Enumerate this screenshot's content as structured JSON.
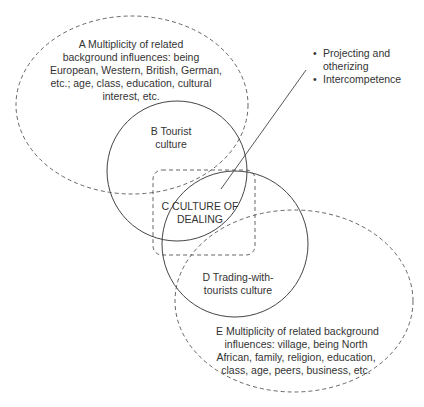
{
  "diagram": {
    "type": "overlapping-sets",
    "colors": {
      "stroke": "#444444",
      "text": "#333333",
      "background": "#ffffff"
    },
    "regions": {
      "A": {
        "letter": "A",
        "lines": [
          "A  Multiplicity of related",
          "background influences: being",
          "European, Western, British, German,",
          "etc.; age, class, education, cultural",
          "interest, etc."
        ],
        "shape": "dashed-ellipse"
      },
      "B": {
        "letter": "B",
        "lines": [
          "B  Tourist",
          "culture"
        ],
        "shape": "solid-circle"
      },
      "C": {
        "letter": "C",
        "lines": [
          "C  CULTURE OF",
          "DEALING"
        ],
        "shape": "dashed-rounded-rectangle"
      },
      "D": {
        "letter": "D",
        "lines": [
          "D  Trading-with-",
          "tourists culture"
        ],
        "shape": "solid-circle"
      },
      "E": {
        "letter": "E",
        "lines": [
          "E  Multiplicity of related background",
          "influences: village, being North",
          "African, family, religion, education,",
          "class, age, peers, business, etc."
        ],
        "shape": "dashed-ellipse"
      }
    },
    "callout": {
      "bullet_symbol": "•",
      "items": [
        {
          "lines": [
            "Projecting and",
            "otherizing"
          ]
        },
        {
          "lines": [
            "Intercompetence"
          ]
        }
      ]
    }
  }
}
